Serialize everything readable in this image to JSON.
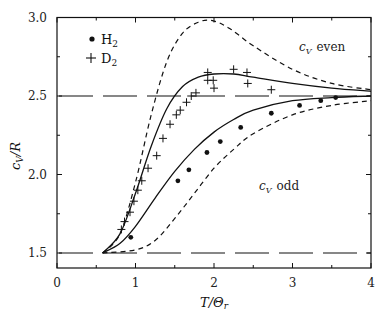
{
  "chart_data": {
    "type": "line",
    "title": "",
    "xlabel": "T/Θr",
    "ylabel": "cV/R",
    "xlim": [
      0,
      4
    ],
    "ylim": [
      1.41,
      3.0
    ],
    "grid": false,
    "legend_position": "upper-left",
    "x_ticks": [
      "0",
      "1",
      "2",
      "3",
      "4"
    ],
    "y_ticks": [
      "1.5",
      "2.0",
      "2.5",
      "3.0"
    ],
    "legend": [
      {
        "marker": "dot",
        "label": "H2"
      },
      {
        "marker": "plus",
        "label": "D2"
      }
    ],
    "annotations": [
      {
        "text": "cV even",
        "x": 3.15,
        "y": 2.83
      },
      {
        "text": "cV odd",
        "x": 2.5,
        "y": 1.97
      }
    ],
    "series": [
      {
        "name": "cV even (theory)",
        "style": "short-dashed",
        "x": [
          0.58,
          0.8,
          1.0,
          1.2,
          1.4,
          1.6,
          1.8,
          1.98,
          2.2,
          2.5,
          3.0,
          3.5,
          4.0
        ],
        "y": [
          1.5,
          1.62,
          1.95,
          2.38,
          2.72,
          2.9,
          2.97,
          2.98,
          2.93,
          2.82,
          2.67,
          2.58,
          2.54
        ]
      },
      {
        "name": "D2 (theory, solid)",
        "style": "solid",
        "x": [
          0.58,
          0.8,
          1.0,
          1.2,
          1.4,
          1.6,
          1.8,
          2.0,
          2.25,
          2.5,
          3.0,
          3.5,
          4.0
        ],
        "y": [
          1.5,
          1.62,
          1.88,
          2.18,
          2.42,
          2.56,
          2.62,
          2.64,
          2.64,
          2.62,
          2.58,
          2.55,
          2.53
        ]
      },
      {
        "name": "H2 (theory, solid)",
        "style": "solid",
        "x": [
          0.58,
          0.8,
          1.0,
          1.25,
          1.5,
          1.75,
          2.0,
          2.25,
          2.5,
          3.0,
          3.5,
          4.0
        ],
        "y": [
          1.5,
          1.56,
          1.67,
          1.85,
          2.02,
          2.16,
          2.27,
          2.35,
          2.41,
          2.47,
          2.49,
          2.5
        ]
      },
      {
        "name": "cV odd (theory)",
        "style": "short-dashed",
        "x": [
          0.58,
          1.0,
          1.25,
          1.5,
          1.75,
          2.0,
          2.25,
          2.5,
          3.0,
          3.5,
          4.0
        ],
        "y": [
          1.5,
          1.52,
          1.58,
          1.72,
          1.88,
          2.04,
          2.16,
          2.26,
          2.38,
          2.44,
          2.47
        ]
      },
      {
        "name": "Classical limits",
        "style": "long-dashed",
        "x": [
          0,
          4
        ],
        "y_levels": [
          1.5,
          2.5
        ]
      },
      {
        "name": "H2",
        "style": "dots",
        "x": [
          0.94,
          1.54,
          1.68,
          1.91,
          2.08,
          2.34,
          2.73,
          3.09,
          3.36,
          3.55
        ],
        "y": [
          1.6,
          1.96,
          2.03,
          2.14,
          2.21,
          2.3,
          2.39,
          2.44,
          2.47,
          2.49
        ]
      },
      {
        "name": "D2",
        "style": "plus",
        "x": [
          0.82,
          0.86,
          0.93,
          0.98,
          1.03,
          1.08,
          1.16,
          1.27,
          1.35,
          1.44,
          1.52,
          1.57,
          1.65,
          1.71,
          1.77,
          1.92,
          1.92,
          1.99,
          2.0,
          2.25,
          2.42,
          2.43,
          2.73
        ],
        "y": [
          1.65,
          1.7,
          1.76,
          1.83,
          1.9,
          1.96,
          2.04,
          2.12,
          2.23,
          2.32,
          2.38,
          2.41,
          2.46,
          2.5,
          2.52,
          2.65,
          2.6,
          2.6,
          2.55,
          2.67,
          2.65,
          2.58,
          2.54
        ]
      }
    ]
  },
  "labels": {
    "x_axis": "T/Θ",
    "x_axis_sub": "r",
    "y_axis": "c",
    "y_axis_sub": "V",
    "y_axis_tail": "/R",
    "legend_h2": "H",
    "legend_d2": "D",
    "legend_sub": "2",
    "ann_even": "even",
    "ann_odd": "odd",
    "ann_c": "c",
    "ann_sub": "V"
  }
}
